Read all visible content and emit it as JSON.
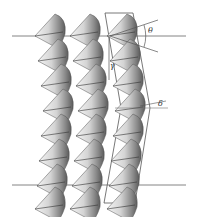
{
  "diagram": {
    "columns": [
      {
        "x": 55,
        "cones": 8
      },
      {
        "x": 90,
        "cones": 8
      },
      {
        "x": 127,
        "cones": 8
      }
    ],
    "cone_rows_y": [
      36,
      60,
      84,
      108,
      133,
      158,
      183,
      203
    ],
    "reference_lines_y": [
      36,
      185
    ],
    "labels": {
      "theta": "θ",
      "gamma": "γ",
      "delta": "δ"
    },
    "colors": {
      "line": "#555555",
      "cone_light": "#e8e8e8",
      "cone_dark": "#6a6a6a"
    }
  }
}
